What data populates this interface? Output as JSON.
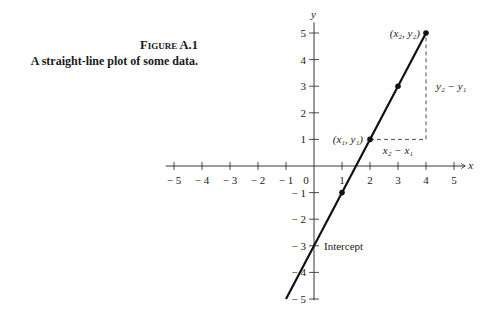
{
  "caption": {
    "figure_label": "Figure A.1",
    "text": "A straight-line plot of some data."
  },
  "chart_data": {
    "type": "line",
    "title": "A straight-line plot of some data.",
    "xlabel": "x",
    "ylabel": "y",
    "xlim": [
      -5,
      5
    ],
    "ylim": [
      -5,
      5
    ],
    "x_ticks": [
      -5,
      -4,
      -3,
      -2,
      -1,
      0,
      1,
      2,
      3,
      4,
      5
    ],
    "y_ticks": [
      -5,
      -4,
      -3,
      -2,
      -1,
      1,
      2,
      3,
      4,
      5
    ],
    "grid": false,
    "series": [
      {
        "name": "line",
        "x": [
          -1,
          4
        ],
        "y": [
          -5,
          5
        ]
      }
    ],
    "points": [
      {
        "x": 1,
        "y": -1
      },
      {
        "x": 2,
        "y": 1,
        "label": "(x1, y1)"
      },
      {
        "x": 3,
        "y": 3
      },
      {
        "x": 4,
        "y": 5,
        "label": "(x2, y2)"
      }
    ],
    "annotations": [
      {
        "text": "x2 − x1",
        "type": "horizontal-dashed",
        "from": [
          2,
          1
        ],
        "to": [
          4,
          1
        ]
      },
      {
        "text": "y2 − y1",
        "type": "vertical-dashed",
        "from": [
          4,
          1
        ],
        "to": [
          4,
          5
        ]
      },
      {
        "text": "Intercept",
        "at": [
          0,
          -3
        ]
      }
    ]
  },
  "labels": {
    "x_axis": "x",
    "y_axis": "y",
    "origin": "0",
    "p1": "(x₁, y₁)",
    "p2": "(x₂, y₂)",
    "dx": "x₂ − x₁",
    "dy": "y₂ − y₁",
    "intercept": "Intercept"
  }
}
